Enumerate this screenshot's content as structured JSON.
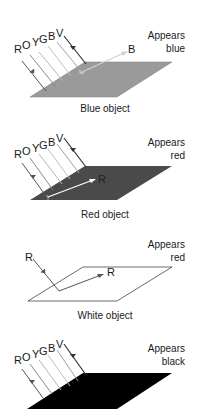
{
  "panels": [
    {
      "id": "blue",
      "caption": "Blue object",
      "appears_line1": "Appears",
      "appears_line2": "blue",
      "incident_labels": [
        "R",
        "O",
        "Y",
        "G",
        "B",
        "V"
      ],
      "reflected_label": "B",
      "surface_color": "#9a9a9a"
    },
    {
      "id": "red",
      "caption": "Red object",
      "appears_line1": "Appears",
      "appears_line2": "red",
      "incident_labels": [
        "R",
        "O",
        "Y",
        "G",
        "B",
        "V"
      ],
      "reflected_label": "R",
      "surface_color": "#4a4a4a"
    },
    {
      "id": "white",
      "caption": "White object",
      "appears_line1": "Appears",
      "appears_line2": "red",
      "incident_labels": [
        "R"
      ],
      "reflected_label": "R",
      "surface_color": "#ffffff"
    },
    {
      "id": "black",
      "caption": "",
      "appears_line1": "Appears",
      "appears_line2": "black",
      "incident_labels": [
        "R",
        "O",
        "Y",
        "G",
        "B",
        "V"
      ],
      "reflected_label": "",
      "surface_color": "#000000"
    }
  ],
  "colors": {
    "ray_dark": "#555555",
    "ray_mid": "#8a8a8a",
    "ray_light": "#b5b5b5",
    "reflected_light": "#d0d0d0",
    "outline": "#444444"
  }
}
